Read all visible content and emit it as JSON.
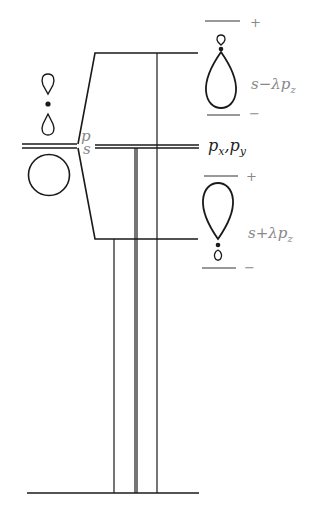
{
  "diagram": {
    "type": "orbital-energy-level-diagram",
    "left": {
      "levels": [
        {
          "label": "p",
          "y": 140
        },
        {
          "label": "s",
          "y": 145
        }
      ],
      "orbitals": [
        "p-orbital-dumbbell",
        "s-orbital-sphere"
      ]
    },
    "right": {
      "levels": [
        {
          "label": "s−λp",
          "sub": "z",
          "y": 53,
          "signs": [
            "+",
            "−"
          ]
        },
        {
          "label": "p",
          "sub": "x",
          "label2": ",p",
          "sub2": "y",
          "y": 145
        },
        {
          "label": "s+λp",
          "sub": "z",
          "y": 239,
          "signs": [
            "+",
            "−"
          ]
        }
      ]
    },
    "baseline_y": 493,
    "colors": {
      "line": "#1a1a1a",
      "label": "#888888",
      "label_dark": "#222222"
    }
  },
  "labels": {
    "p_left": "p",
    "s_left": "s",
    "anti_main": "s−λp",
    "anti_sub": "z",
    "bond_main": "s+λp",
    "bond_sub": "z",
    "pxpy_a": "p",
    "pxpy_a_sub": "x",
    "pxpy_b": ",p",
    "pxpy_b_sub": "y",
    "plus": "+",
    "minus": "−"
  }
}
